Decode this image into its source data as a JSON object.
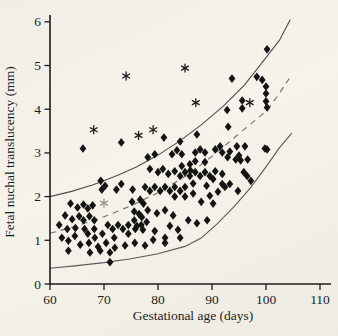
{
  "figure": {
    "kind": "scanned scatter plot of fetal nuchal translucency versus gestational age with three centile curves",
    "colors": {
      "paper": "#f4f1e8",
      "ink": "#1c1c1c",
      "marker": "#141414",
      "curve_solid": "#525252",
      "curve_dashed": "#6e6e6e",
      "asterisk_gray": "#9a968c"
    }
  },
  "chart_data": {
    "type": "scatter",
    "title": "",
    "xlabel": "Gestational age (days)",
    "ylabel": "Fetal nuchal translucency (mm)",
    "xlim": [
      60,
      110
    ],
    "ylim": [
      0,
      6
    ],
    "x_ticks": [
      60,
      70,
      80,
      90,
      100,
      110
    ],
    "y_ticks": [
      0,
      1,
      2,
      3,
      4,
      5,
      6
    ],
    "grid": false,
    "legend_position": "none",
    "series": [
      {
        "name": "fetal-nt-measurements",
        "marker": "diamond",
        "color": "#141414",
        "points": [
          [
            61.7,
            1.35
          ],
          [
            62.2,
            1.06
          ],
          [
            62.8,
            1.57
          ],
          [
            63.2,
            1.26
          ],
          [
            63.4,
            0.99
          ],
          [
            63.4,
            0.76
          ],
          [
            63.8,
            1.84
          ],
          [
            64.1,
            1.48
          ],
          [
            64.6,
            1.1
          ],
          [
            64.7,
            1.28
          ],
          [
            65.1,
            1.75
          ],
          [
            65.4,
            1.55
          ],
          [
            65.6,
            0.9
          ],
          [
            66.1,
            3.1
          ],
          [
            66.2,
            1.82
          ],
          [
            66.2,
            1.46
          ],
          [
            66.4,
            1.26
          ],
          [
            67.0,
            1.73
          ],
          [
            67.0,
            1.15
          ],
          [
            67.2,
            0.94
          ],
          [
            67.3,
            1.55
          ],
          [
            67.4,
            0.72
          ],
          [
            67.9,
            1.8
          ],
          [
            68.2,
            1.46
          ],
          [
            68.2,
            1.26
          ],
          [
            68.3,
            1.06
          ],
          [
            68.9,
            0.85
          ],
          [
            69.3,
            0.76
          ],
          [
            69.4,
            2.36
          ],
          [
            69.6,
            2.16
          ],
          [
            69.7,
            1.15
          ],
          [
            70.2,
            2.25
          ],
          [
            70.4,
            0.94
          ],
          [
            70.7,
            1.35
          ],
          [
            71.1,
            0.72
          ],
          [
            71.1,
            0.5
          ],
          [
            71.6,
            1.26
          ],
          [
            71.9,
            1.06
          ],
          [
            72.0,
            0.83
          ],
          [
            72.3,
            2.16
          ],
          [
            72.6,
            1.35
          ],
          [
            73.2,
            3.24
          ],
          [
            73.2,
            2.29
          ],
          [
            73.5,
            1.26
          ],
          [
            73.9,
            0.88
          ],
          [
            74.5,
            1.35
          ],
          [
            74.5,
            1.15
          ],
          [
            75.2,
            1.88
          ],
          [
            75.3,
            2.16
          ],
          [
            75.6,
            1.66
          ],
          [
            75.6,
            1.46
          ],
          [
            75.7,
            0.94
          ],
          [
            75.8,
            1.26
          ],
          [
            76.1,
            1.33
          ],
          [
            76.5,
            1.6
          ],
          [
            76.7,
            1.93
          ],
          [
            76.9,
            1.35
          ],
          [
            77.0,
            1.53
          ],
          [
            77.2,
            1.24
          ],
          [
            77.3,
            1.84
          ],
          [
            77.6,
            2.22
          ],
          [
            77.6,
            0.88
          ],
          [
            77.9,
            1.42
          ],
          [
            78.1,
            2.9
          ],
          [
            78.1,
            1.69
          ],
          [
            78.5,
            2.63
          ],
          [
            78.5,
            2.13
          ],
          [
            79.1,
            1.01
          ],
          [
            79.4,
            2.97
          ],
          [
            79.4,
            2.22
          ],
          [
            79.4,
            1.21
          ],
          [
            79.8,
            1.62
          ],
          [
            80.0,
            2.56
          ],
          [
            80.4,
            2.13
          ],
          [
            80.9,
            2.63
          ],
          [
            81.1,
            3.35
          ],
          [
            81.3,
            2.22
          ],
          [
            81.3,
            1.69
          ],
          [
            81.3,
            1.06
          ],
          [
            81.3,
            0.94
          ],
          [
            81.9,
            2.52
          ],
          [
            82.2,
            2.13
          ],
          [
            82.2,
            1.33
          ],
          [
            82.6,
            2.97
          ],
          [
            82.8,
            1.57
          ],
          [
            83.1,
            2.58
          ],
          [
            83.1,
            2.22
          ],
          [
            83.1,
            2.0
          ],
          [
            83.5,
            3.06
          ],
          [
            83.7,
            1.24
          ],
          [
            84.1,
            3.26
          ],
          [
            84.1,
            2.47
          ],
          [
            84.1,
            2.13
          ],
          [
            84.1,
            1.06
          ],
          [
            84.4,
            2.97
          ],
          [
            84.4,
            2.7
          ],
          [
            85.0,
            2.56
          ],
          [
            85.0,
            2.22
          ],
          [
            85.0,
            2.0
          ],
          [
            85.6,
            1.46
          ],
          [
            85.9,
            2.74
          ],
          [
            85.9,
            2.47
          ],
          [
            86.0,
            2.6
          ],
          [
            86.5,
            2.3
          ],
          [
            86.5,
            2.07
          ],
          [
            86.9,
            3.01
          ],
          [
            86.9,
            2.81
          ],
          [
            86.9,
            2.56
          ],
          [
            87.2,
            3.42
          ],
          [
            87.2,
            1.39
          ],
          [
            87.8,
            3.08
          ],
          [
            87.8,
            2.47
          ],
          [
            88.0,
            1.88
          ],
          [
            88.7,
            3.01
          ],
          [
            88.7,
            2.79
          ],
          [
            88.7,
            2.56
          ],
          [
            89.0,
            2.25
          ],
          [
            89.1,
            1.46
          ],
          [
            89.6,
            2.47
          ],
          [
            89.6,
            2.02
          ],
          [
            90.2,
            2.4
          ],
          [
            90.2,
            1.84
          ],
          [
            90.6,
            3.08
          ],
          [
            90.6,
            2.58
          ],
          [
            91.1,
            2.11
          ],
          [
            91.5,
            3.15
          ],
          [
            91.9,
            3.01
          ],
          [
            91.9,
            2.52
          ],
          [
            91.9,
            2.29
          ],
          [
            92.4,
            2.22
          ],
          [
            92.8,
            3.98
          ],
          [
            92.9,
            2.9
          ],
          [
            93.0,
            3.6
          ],
          [
            93.3,
            3.03
          ],
          [
            93.3,
            2.29
          ],
          [
            93.7,
            4.7
          ],
          [
            94.4,
            2.85
          ],
          [
            94.6,
            3.15
          ],
          [
            94.8,
            2.13
          ],
          [
            95.0,
            2.94
          ],
          [
            95.3,
            2.83
          ],
          [
            95.6,
            4.2
          ],
          [
            95.6,
            4.02
          ],
          [
            95.9,
            2.56
          ],
          [
            96.1,
            3.15
          ],
          [
            96.5,
            2.47
          ],
          [
            96.6,
            2.85
          ],
          [
            97.2,
            2.36
          ],
          [
            98.3,
            4.74
          ],
          [
            99.3,
            4.67
          ],
          [
            99.8,
            3.1
          ],
          [
            100.0,
            4.52
          ],
          [
            100.0,
            4.36
          ],
          [
            100.0,
            4.18
          ],
          [
            100.2,
            4.04
          ],
          [
            100.2,
            5.37
          ],
          [
            100.2,
            3.08
          ]
        ]
      },
      {
        "name": "outliers-asterisk",
        "marker": "asterisk",
        "color": "#1c1c1c",
        "points": [
          [
            68.1,
            3.53
          ],
          [
            74.1,
            4.76
          ],
          [
            76.4,
            3.4
          ],
          [
            79.1,
            3.53
          ],
          [
            85.0,
            4.94
          ],
          [
            87.0,
            4.15
          ],
          [
            97.0,
            4.15
          ]
        ]
      },
      {
        "name": "outlier-asterisk-gray",
        "marker": "asterisk",
        "color": "#9a968c",
        "points": [
          [
            70.0,
            1.85
          ]
        ]
      }
    ],
    "curves": [
      {
        "name": "upper-centile-95th",
        "style": "solid",
        "color": "#4f4f4f",
        "points": [
          [
            60,
            2.0
          ],
          [
            64,
            2.12
          ],
          [
            68,
            2.27
          ],
          [
            72,
            2.46
          ],
          [
            76,
            2.68
          ],
          [
            80,
            2.95
          ],
          [
            84,
            3.27
          ],
          [
            88,
            3.64
          ],
          [
            92,
            4.06
          ],
          [
            96,
            4.55
          ],
          [
            100,
            5.18
          ],
          [
            102.5,
            5.58
          ],
          [
            104.5,
            6.05
          ]
        ]
      },
      {
        "name": "middle-centile-50th",
        "style": "dashed",
        "color": "#6e6e6e",
        "points": [
          [
            60,
            1.16
          ],
          [
            65,
            1.33
          ],
          [
            70,
            1.54
          ],
          [
            75,
            1.79
          ],
          [
            80,
            2.09
          ],
          [
            85,
            2.46
          ],
          [
            90,
            2.92
          ],
          [
            95,
            3.44
          ],
          [
            100,
            3.95
          ],
          [
            102,
            4.28
          ],
          [
            104.3,
            4.7
          ]
        ]
      },
      {
        "name": "lower-centile-5th",
        "style": "solid",
        "color": "#5a5a5a",
        "points": [
          [
            60,
            0.36
          ],
          [
            65,
            0.42
          ],
          [
            70,
            0.49
          ],
          [
            75,
            0.58
          ],
          [
            80,
            0.69
          ],
          [
            85,
            0.86
          ],
          [
            88,
            1.05
          ],
          [
            91,
            1.38
          ],
          [
            94,
            1.76
          ],
          [
            97,
            2.18
          ],
          [
            100,
            2.68
          ],
          [
            102.5,
            3.12
          ],
          [
            104.8,
            3.45
          ]
        ]
      }
    ]
  }
}
